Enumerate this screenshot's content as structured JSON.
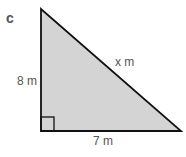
{
  "part_label": "c",
  "triangle": {
    "fill": "#d4d4d4",
    "stroke": "#111111",
    "vertical_side": "8 m",
    "horizontal_side": "7 m",
    "hypotenuse": "x m",
    "right_angle": "bottom-left"
  }
}
